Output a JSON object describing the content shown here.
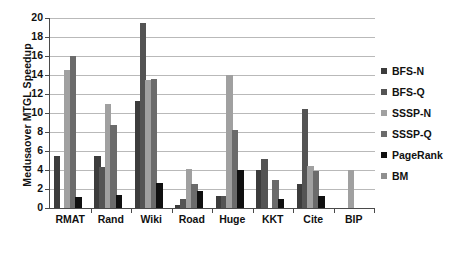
{
  "chart_data": {
    "type": "bar",
    "title": "",
    "xlabel": "",
    "ylabel": "Medusaover MTGL Speedup",
    "ylim": [
      0,
      20
    ],
    "yticks": [
      0,
      2,
      4,
      6,
      8,
      10,
      12,
      14,
      16,
      18,
      20
    ],
    "grid": true,
    "legend_position": "right",
    "categories": [
      "RMAT",
      "Rand",
      "Wiki",
      "Road",
      "Huge",
      "KKT",
      "Cite",
      "BIP"
    ],
    "series": [
      {
        "name": "BFS-N",
        "color": "#3c3c3c",
        "values": [
          5.5,
          5.45,
          11.3,
          0.35,
          1.3,
          3.95,
          2.55,
          0
        ]
      },
      {
        "name": "BFS-Q",
        "color": "#545454",
        "values": [
          0,
          4.35,
          19.5,
          1.0,
          1.25,
          5.2,
          10.4,
          0
        ]
      },
      {
        "name": "SSSP-N",
        "color": "#a0a0a0",
        "values": [
          14.55,
          11.0,
          13.5,
          4.1,
          14.0,
          0,
          4.45,
          4.0
        ]
      },
      {
        "name": "SSSP-Q",
        "color": "#6b6b6b",
        "values": [
          15.95,
          8.7,
          13.6,
          2.55,
          8.2,
          3.0,
          3.9,
          0
        ]
      },
      {
        "name": "PageRank",
        "color": "#101010",
        "values": [
          1.2,
          1.4,
          2.65,
          1.75,
          4.0,
          0.95,
          1.25,
          0
        ]
      },
      {
        "name": "BM",
        "color": "#8f8f8f",
        "values": [
          0,
          0,
          0,
          0,
          0,
          0,
          0,
          0
        ]
      }
    ]
  },
  "legend": {
    "items": [
      {
        "label": "BFS-N",
        "color": "#3c3c3c"
      },
      {
        "label": "BFS-Q",
        "color": "#545454"
      },
      {
        "label": "SSSP-N",
        "color": "#a0a0a0"
      },
      {
        "label": "SSSP-Q",
        "color": "#6b6b6b"
      },
      {
        "label": "PageRank",
        "color": "#101010"
      },
      {
        "label": "BM",
        "color": "#8f8f8f"
      }
    ]
  },
  "axis": {
    "y_title": "Medusaover MTGL Speedup",
    "y_tick_labels": [
      "0",
      "2",
      "4",
      "6",
      "8",
      "10",
      "12",
      "14",
      "16",
      "18",
      "20"
    ],
    "x_tick_labels": [
      "RMAT",
      "Rand",
      "Wiki",
      "Road",
      "Huge",
      "KKT",
      "Cite",
      "BIP"
    ]
  }
}
